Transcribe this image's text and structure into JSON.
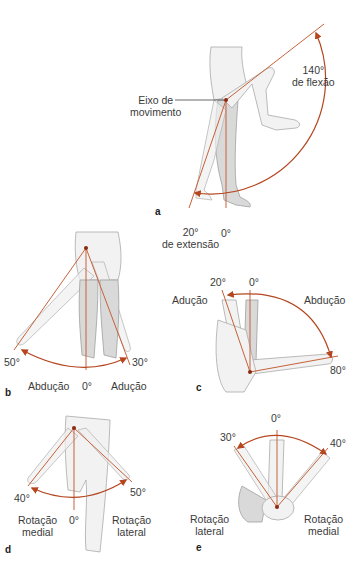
{
  "colors": {
    "axis_line": "#c5623a",
    "arc": "#b5461f",
    "pivot": "#8a2a10",
    "limb_fill": "#f2f2f2",
    "limb_stroke": "#a9a9a9",
    "text": "#3a3a3a"
  },
  "panels": {
    "a": {
      "letter": "a",
      "movement": "Flexão / Extensão",
      "axis_label_line1": "Eixo de",
      "axis_label_line2": "movimento",
      "flexion_value": "140°",
      "flexion_label": "de flexão",
      "extension_value": "20°",
      "extension_label": "de extensão",
      "neutral": "0°"
    },
    "b": {
      "letter": "b",
      "movement": "Abdução / Adução (em pé)",
      "abduction_value": "50°",
      "adduction_value": "30°",
      "neutral": "0°",
      "abduction_label": "Abdução",
      "adduction_label": "Adução"
    },
    "c": {
      "letter": "c",
      "movement": "Abdução / Adução (deitado)",
      "adduction_value": "20°",
      "abduction_value": "80°",
      "neutral": "0°",
      "adduction_label": "Adução",
      "abduction_label": "Abdução"
    },
    "d": {
      "letter": "d",
      "movement": "Rotação (em pé)",
      "medial_value": "40°",
      "lateral_value": "50°",
      "neutral": "0°",
      "medial_label_line1": "Rotação",
      "medial_label_line2": "medial",
      "lateral_label_line1": "Rotação",
      "lateral_label_line2": "lateral"
    },
    "e": {
      "letter": "e",
      "movement": "Rotação (deitado)",
      "lateral_value": "30°",
      "medial_value": "40°",
      "neutral": "0°",
      "lateral_label_line1": "Rotação",
      "lateral_label_line2": "lateral",
      "medial_label_line1": "Rotação",
      "medial_label_line2": "medial"
    }
  }
}
